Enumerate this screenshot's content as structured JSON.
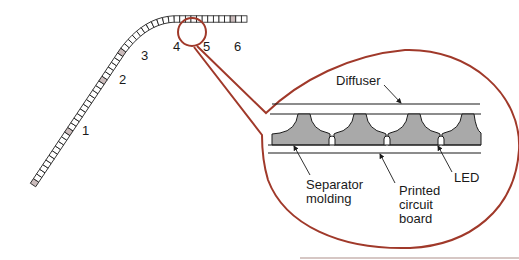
{
  "figure": {
    "strip_positions": [
      {
        "label": "1"
      },
      {
        "label": "2"
      },
      {
        "label": "3"
      },
      {
        "label": "4"
      },
      {
        "label": "5"
      },
      {
        "label": "6"
      }
    ],
    "callout_labels": {
      "diffuser": "Diffuser",
      "separator_line1": "Separator",
      "separator_line2": "molding",
      "pcb_line1": "Printed",
      "pcb_line2": "circuit",
      "pcb_line3": "board",
      "led": "LED"
    },
    "colors": {
      "callout_outline": "#a0392a",
      "molding_fill": "#a9a9a9",
      "shaded_tile": "#cbbcbc",
      "line": "#1a1a1a"
    }
  }
}
